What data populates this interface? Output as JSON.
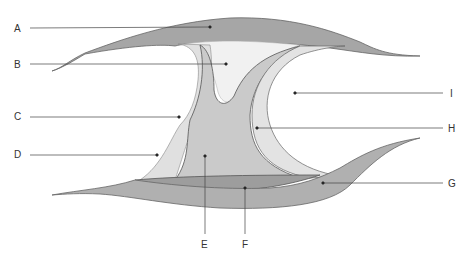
{
  "diagram": {
    "type": "anatomical cross-section (synovial joint)",
    "labels": [
      {
        "id": "A",
        "text": "A",
        "x": 14,
        "y": 24,
        "target": [
          210,
          27
        ]
      },
      {
        "id": "B",
        "text": "B",
        "x": 14,
        "y": 60,
        "target": [
          226,
          64
        ]
      },
      {
        "id": "C",
        "text": "C",
        "x": 14,
        "y": 112,
        "target": [
          179,
          117
        ]
      },
      {
        "id": "D",
        "text": "D",
        "x": 14,
        "y": 150,
        "target": [
          157,
          155
        ]
      },
      {
        "id": "E",
        "text": "E",
        "x": 200,
        "y": 240,
        "target": [
          205,
          156
        ]
      },
      {
        "id": "F",
        "text": "F",
        "x": 241,
        "y": 240,
        "target": [
          245,
          188
        ]
      },
      {
        "id": "G",
        "text": "G",
        "x": 448,
        "y": 180,
        "target": [
          323,
          183
        ]
      },
      {
        "id": "H",
        "text": "H",
        "x": 448,
        "y": 124,
        "target": [
          257,
          128
        ]
      },
      {
        "id": "I",
        "text": "I",
        "x": 449,
        "y": 88,
        "target": [
          295,
          93
        ]
      }
    ],
    "colors": {
      "dark_band": "#9a9a9a",
      "mid_fill": "#c8c8c8",
      "light_fill": "#e2e2e2",
      "pale_fill": "#efefef",
      "outline": "#555555",
      "leader": "#444444"
    }
  }
}
